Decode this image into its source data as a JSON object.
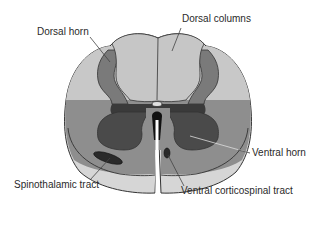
{
  "figure": {
    "labels": {
      "dorsal_horn": "Dorsal horn",
      "dorsal_columns": "Dorsal columns",
      "ventral_horn": "Ventral horn",
      "spinothalamic_tract": "Spinothalamic tract",
      "ventral_corticospinal_tract": "Ventral corticospinal tract"
    },
    "colors": {
      "background": "#ffffff",
      "outline": "#333333",
      "white_matter_light": "#c8c8c8",
      "white_matter_mid": "#8e8e8e",
      "white_matter_ventral_rim": "#d6d6d6",
      "gray_matter_dorsal": "#7a7a7a",
      "gray_matter_ventral": "#4a4a4a",
      "central_dark": "#3a3a3a",
      "tract_dark": "#2a2a2a",
      "canal": "#e0e0e0",
      "fissure": "#ffffff",
      "leader_line": "#444444"
    }
  }
}
